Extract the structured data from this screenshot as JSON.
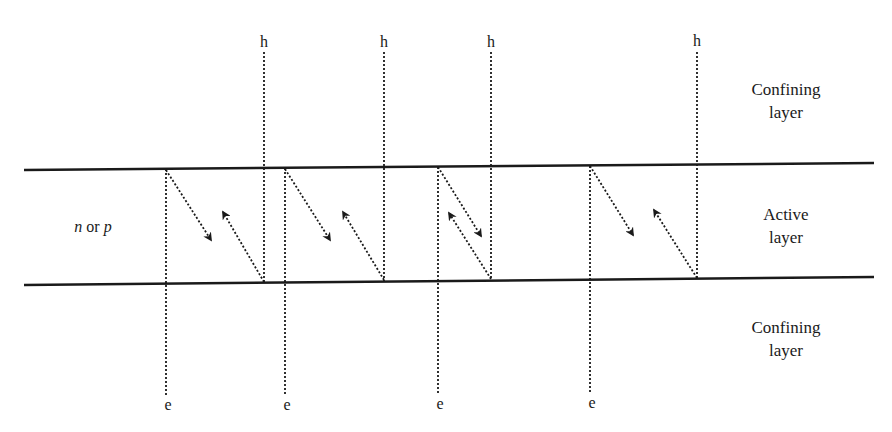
{
  "diagram": {
    "type": "semiconductor-heterostructure",
    "layers": [
      {
        "name": "top-confining",
        "label_line1": "Confining",
        "label_line2": "layer"
      },
      {
        "name": "active",
        "label_line1": "Active",
        "label_line2": "layer"
      },
      {
        "name": "bottom-confining",
        "label_line1": "Confining",
        "label_line2": "layer"
      }
    ],
    "active_region_label": {
      "italic1": "n",
      "middle": " or ",
      "italic2": "p"
    },
    "carriers": {
      "hole_label": "h",
      "electron_label": "e"
    },
    "transitions": [
      {
        "e_x": 166,
        "h_x": 264
      },
      {
        "e_x": 285,
        "h_x": 384
      },
      {
        "e_x": 438,
        "h_x": 491
      },
      {
        "e_x": 590,
        "h_x": 697
      }
    ],
    "colors": {
      "line": "#1a1a1a",
      "background": "#ffffff"
    }
  }
}
